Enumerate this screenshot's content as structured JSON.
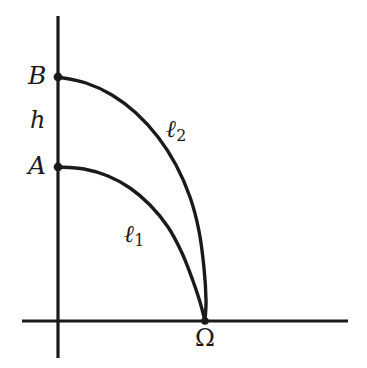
{
  "figure": {
    "background_color": "#ffffff",
    "stroke_color": "#1a1a1a",
    "axis_stroke_width": 3.2,
    "curve_stroke_width": 3.4,
    "point_radius": 4.2
  },
  "labels": {
    "point_b": "B",
    "height_h": "h",
    "point_a": "A",
    "curve_one_base": "ℓ",
    "curve_one_sub": "1",
    "curve_two_base": "ℓ",
    "curve_two_sub": "2",
    "point_omega": "Ω"
  },
  "chart_data": {
    "type": "line",
    "title": "",
    "xlabel": "",
    "ylabel": "",
    "grid": false,
    "legend": "none",
    "axes": {
      "vertical_axis": {
        "x": 58,
        "y_top": 16,
        "y_bottom": 358
      },
      "horizontal_axis": {
        "y": 321,
        "x_left": 22,
        "x_right": 348
      },
      "origin_on_screen": {
        "x": 58,
        "y": 321
      }
    },
    "points": [
      {
        "name": "B",
        "x": 58,
        "y": 77,
        "label": "B",
        "label_x": 30,
        "label_y": 66
      },
      {
        "name": "A",
        "x": 58,
        "y": 167,
        "label": "A",
        "label_x": 30,
        "label_y": 156
      },
      {
        "name": "Omega",
        "x": 205,
        "y": 321,
        "label": "Ω",
        "label_x": 196,
        "label_y": 327
      }
    ],
    "segments": [
      {
        "name": "h",
        "from": "A",
        "to": "B",
        "label": "h",
        "label_x": 32,
        "label_y": 110
      }
    ],
    "series": [
      {
        "name": "ℓ1",
        "label": "ℓ₁",
        "from": "A",
        "to": "Omega",
        "label_x": 124,
        "label_y": 222,
        "path_points": [
          [
            58,
            167
          ],
          [
            84,
            169
          ],
          [
            108,
            176
          ],
          [
            130,
            188
          ],
          [
            150,
            205
          ],
          [
            168,
            227
          ],
          [
            182,
            253
          ],
          [
            193,
            281
          ],
          [
            200,
            302
          ],
          [
            205,
            321
          ]
        ]
      },
      {
        "name": "ℓ2",
        "label": "ℓ₂",
        "from": "B",
        "to": "Omega",
        "label_x": 166,
        "label_y": 117,
        "path_points": [
          [
            58,
            77
          ],
          [
            86,
            83
          ],
          [
            112,
            95
          ],
          [
            136,
            113
          ],
          [
            158,
            137
          ],
          [
            176,
            165
          ],
          [
            190,
            197
          ],
          [
            199,
            231
          ],
          [
            204,
            268
          ],
          [
            206,
            300
          ],
          [
            205,
            321
          ]
        ]
      }
    ]
  }
}
